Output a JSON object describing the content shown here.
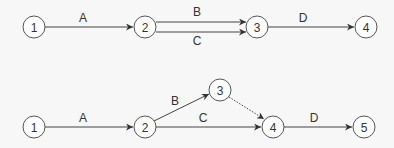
{
  "diagrams": [
    {
      "name": "network-with-parallel-activities",
      "nodes": [
        {
          "id": "1",
          "label": "1",
          "x": 34,
          "y": 27
        },
        {
          "id": "2",
          "label": "2",
          "x": 145,
          "y": 27
        },
        {
          "id": "3",
          "label": "3",
          "x": 257,
          "y": 27
        },
        {
          "id": "4",
          "label": "4",
          "x": 366,
          "y": 27
        }
      ],
      "edges": [
        {
          "label": "A",
          "from": "1",
          "to": "2",
          "style": "solid"
        },
        {
          "label": "B",
          "from": "2",
          "to": "3",
          "style": "solid",
          "offset": -5
        },
        {
          "label": "C",
          "from": "2",
          "to": "3",
          "style": "solid",
          "offset": 5
        },
        {
          "label": "D",
          "from": "3",
          "to": "4",
          "style": "solid"
        }
      ]
    },
    {
      "name": "network-with-dummy-activity",
      "nodes": [
        {
          "id": "1",
          "label": "1",
          "x": 34,
          "y": 127
        },
        {
          "id": "2",
          "label": "2",
          "x": 145,
          "y": 127
        },
        {
          "id": "3",
          "label": "3",
          "x": 220,
          "y": 90
        },
        {
          "id": "4",
          "label": "4",
          "x": 273,
          "y": 127
        },
        {
          "id": "5",
          "label": "5",
          "x": 364,
          "y": 127
        }
      ],
      "edges": [
        {
          "label": "A",
          "from": "1",
          "to": "2",
          "style": "solid"
        },
        {
          "label": "B",
          "from": "2",
          "to": "3",
          "style": "solid"
        },
        {
          "label": "C",
          "from": "2",
          "to": "4",
          "style": "solid"
        },
        {
          "label": "",
          "from": "3",
          "to": "4",
          "style": "dotted"
        },
        {
          "label": "D",
          "from": "4",
          "to": "5",
          "style": "solid"
        }
      ]
    }
  ],
  "labels": {
    "top": {
      "A": "A",
      "B": "B",
      "C": "C",
      "D": "D",
      "n1": "1",
      "n2": "2",
      "n3": "3",
      "n4": "4"
    },
    "bottom": {
      "A": "A",
      "B": "B",
      "C": "C",
      "D": "D",
      "n1": "1",
      "n2": "2",
      "n3": "3",
      "n4": "4",
      "n5": "5"
    }
  },
  "colors": {
    "stroke": "#444444",
    "node_fill": "#ffffff",
    "text": "#333333",
    "background": "#f7f7f7"
  }
}
